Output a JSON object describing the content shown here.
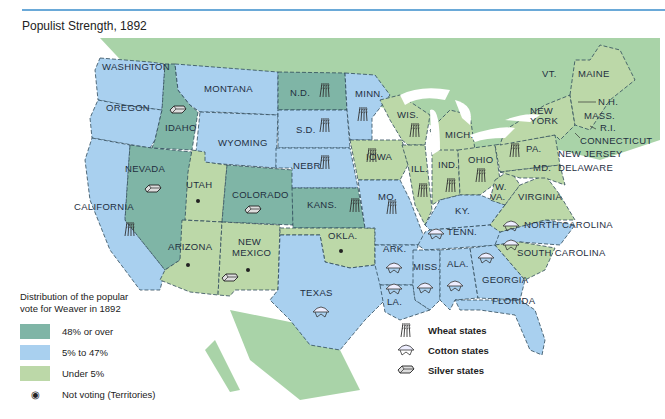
{
  "title": "Populist Strength, 1892",
  "colors": {
    "over48": "#7fb5a6",
    "mid": "#a9d0ef",
    "under5": "#bcd8a8",
    "land": "#a9d3a8",
    "water": "#ffffff",
    "rule": "#6aa9d8"
  },
  "legend": {
    "heading_line1": "Distribution of the popular",
    "heading_line2": "vote for Weaver in 1892",
    "items": [
      {
        "label": "48% or over",
        "color": "#7fb5a6"
      },
      {
        "label": "5% to 47%",
        "color": "#a9d0ef"
      },
      {
        "label": "Under 5%",
        "color": "#bcd8a8"
      },
      {
        "label": "Not voting (Territories)",
        "symbol": "dot"
      }
    ]
  },
  "symbol_legend": [
    {
      "label": "Wheat states",
      "icon": "wheat-icon"
    },
    {
      "label": "Cotton states",
      "icon": "cotton-icon"
    },
    {
      "label": "Silver states",
      "icon": "silver-icon"
    }
  ],
  "states": {
    "washington": "WASHINGTON",
    "oregon": "OREGON",
    "california": "CALIFORNIA",
    "idaho": "IDAHO",
    "nevada": "NEVADA",
    "montana": "MONTANA",
    "wyoming": "WYOMING",
    "utah": "UTAH",
    "colorado": "COLORADO",
    "arizona": "ARIZONA",
    "new_mexico_1": "NEW",
    "new_mexico_2": "MEXICO",
    "nd": "N.D.",
    "sd": "S.D.",
    "nebr": "NEBR.",
    "kans": "KANS.",
    "okla": "OKLA.",
    "texas": "TEXAS",
    "minn": "MINN.",
    "iowa": "IOWA",
    "mo": "MO.",
    "ark": "ARK.",
    "la": "LA.",
    "wis": "WIS.",
    "ill": "ILL.",
    "mich": "MICH.",
    "ind": "IND.",
    "ohio": "OHIO",
    "ky": "KY.",
    "tenn": "TENN.",
    "miss": "MISS.",
    "ala": "ALA.",
    "georgia": "GEORGIA",
    "florida": "FLORIDA",
    "nc": "NORTH CAROLINA",
    "sc": "SOUTH CAROLINA",
    "wva_1": "W.",
    "wva_2": "VA.",
    "virginia": "VIRGINIA",
    "md": "MD.",
    "delaware": "DELAWARE",
    "pa": "PA.",
    "new_jersey": "NEW JERSEY",
    "ny_1": "NEW",
    "ny_2": "YORK",
    "vt": "VT.",
    "maine": "MAINE",
    "nh": "N.H.",
    "mass": "MASS.",
    "ri": "R.I.",
    "connecticut": "CONNECTICUT"
  }
}
